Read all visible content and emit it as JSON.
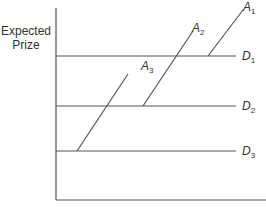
{
  "diagram": {
    "y_axis_label_line1": "Expected",
    "y_axis_label_line2": "Prize",
    "x_axis_label": "",
    "horizontal_lines": [
      {
        "name": "D",
        "sub": "1",
        "y": 56
      },
      {
        "name": "D",
        "sub": "2",
        "y": 106
      },
      {
        "name": "D",
        "sub": "3",
        "y": 151
      }
    ],
    "diagonal_lines": [
      {
        "name": "A",
        "sub": "1",
        "x1": 208,
        "y1": 56,
        "x2": 243,
        "y2": 10
      },
      {
        "name": "A",
        "sub": "2",
        "x1": 143,
        "y1": 106,
        "x2": 193,
        "y2": 31
      },
      {
        "name": "A",
        "sub": "3",
        "x1": 77,
        "y1": 151,
        "x2": 128,
        "y2": 74
      }
    ],
    "line_color": "#555555"
  }
}
